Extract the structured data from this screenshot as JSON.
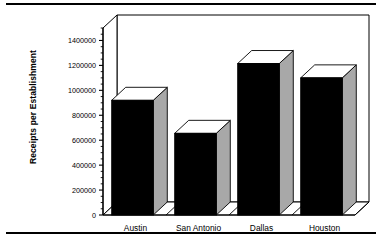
{
  "chart_data": {
    "type": "bar",
    "title": "",
    "subtitle": "",
    "xlabel": "",
    "ylabel": "Receipts per Establishment",
    "categories": [
      "Austin",
      "San Antonio",
      "Dallas",
      "Houston"
    ],
    "values": [
      920000,
      655000,
      1215000,
      1100000
    ],
    "series": [
      {
        "name": "Receipts per Establishment",
        "values": [
          920000,
          655000,
          1215000,
          1100000
        ]
      }
    ],
    "ylim": [
      0,
      1500000
    ],
    "ytick_labels": [
      "0",
      "200000",
      "400000",
      "600000",
      "800000",
      "1000000",
      "1200000",
      "1400000"
    ],
    "ytick_values": [
      0,
      200000,
      400000,
      600000,
      800000,
      1000000,
      1200000,
      1400000
    ],
    "minor_ticks": true,
    "grid": false,
    "legend": false,
    "legend_position": "none",
    "style": "3d-bar",
    "colors": {
      "bar_front": "#000000",
      "bar_side": "#a8a8a8",
      "bar_top": "#ffffff",
      "axis": "#000000",
      "plot_background": "#ffffff",
      "page_background": "#ffffff"
    }
  },
  "page": {
    "rule_top": "",
    "rule_bottom": ""
  }
}
